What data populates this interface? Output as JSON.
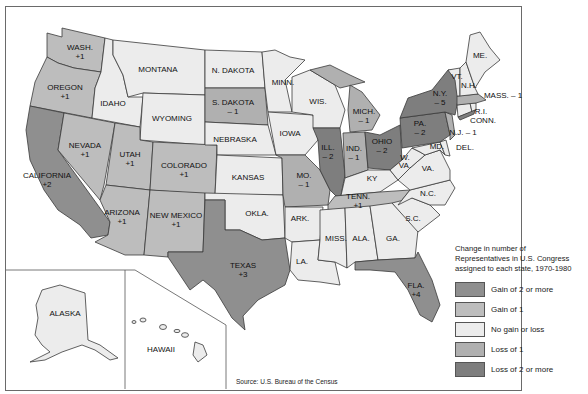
{
  "colors": {
    "gain2": "#8f8f8f",
    "gain1": "#bdbdbd",
    "none": "#ececec",
    "loss1": "#b0b0b0",
    "loss2": "#7e7e7e",
    "border": "#3a3a3a",
    "water": "#ffffff"
  },
  "legend": {
    "title_line1": "Change in number of",
    "title_line2": "Representatives in U.S. Congress",
    "title_line3": "assigned to each state, 1970-1980",
    "items": [
      {
        "key": "gain2",
        "label": "Gain of 2 or more"
      },
      {
        "key": "gain1",
        "label": "Gain of 1"
      },
      {
        "key": "none",
        "label": "No gain or loss"
      },
      {
        "key": "loss1",
        "label": "Loss of 1"
      },
      {
        "key": "loss2",
        "label": "Loss of 2 or more"
      }
    ]
  },
  "source": "Source: U.S. Bureau of the Census",
  "states": {
    "wash": {
      "name": "WASH.",
      "change": "+1"
    },
    "oregon": {
      "name": "OREGON",
      "change": "+1"
    },
    "california": {
      "name": "CALIFORNIA",
      "change": "+2"
    },
    "nevada": {
      "name": "NEVADA",
      "change": "+1"
    },
    "idaho": {
      "name": "IDAHO",
      "change": ""
    },
    "montana": {
      "name": "MONTANA",
      "change": ""
    },
    "wyoming": {
      "name": "WYOMING",
      "change": ""
    },
    "utah": {
      "name": "UTAH",
      "change": "+1"
    },
    "colorado": {
      "name": "COLORADO",
      "change": "+1"
    },
    "arizona": {
      "name": "ARIZONA",
      "change": "+1"
    },
    "newmexico": {
      "name": "NEW MEXICO",
      "change": "+1"
    },
    "ndakota": {
      "name": "N. DAKOTA",
      "change": ""
    },
    "sdakota": {
      "name": "S. DAKOTA",
      "change": "– 1"
    },
    "nebraska": {
      "name": "NEBRASKA",
      "change": ""
    },
    "kansas": {
      "name": "KANSAS",
      "change": ""
    },
    "okla": {
      "name": "OKLA.",
      "change": ""
    },
    "texas": {
      "name": "TEXAS",
      "change": "+3"
    },
    "minn": {
      "name": "MINN.",
      "change": ""
    },
    "iowa": {
      "name": "IOWA",
      "change": ""
    },
    "mo": {
      "name": "MO.",
      "change": "– 1"
    },
    "ark": {
      "name": "ARK.",
      "change": ""
    },
    "la": {
      "name": "LA.",
      "change": ""
    },
    "wis": {
      "name": "WIS.",
      "change": ""
    },
    "ill": {
      "name": "ILL.",
      "change": "– 2"
    },
    "mich": {
      "name": "MICH.",
      "change": "– 1"
    },
    "ind": {
      "name": "IND.",
      "change": "– 1"
    },
    "ohio": {
      "name": "OHIO",
      "change": "– 2"
    },
    "ky": {
      "name": "KY",
      "change": ""
    },
    "tenn": {
      "name": "TENN.",
      "change": "+1"
    },
    "miss": {
      "name": "MISS.",
      "change": ""
    },
    "ala": {
      "name": "ALA.",
      "change": ""
    },
    "ga": {
      "name": "GA.",
      "change": ""
    },
    "fla": {
      "name": "FLA.",
      "change": "+4"
    },
    "sc": {
      "name": "S.C.",
      "change": ""
    },
    "nc": {
      "name": "N.C.",
      "change": ""
    },
    "va": {
      "name": "VA.",
      "change": ""
    },
    "wva_1": "W.",
    "wva_2": "VA.",
    "md": {
      "name": "MD.",
      "change": ""
    },
    "del": {
      "name": "DEL.",
      "change": ""
    },
    "pa": {
      "name": "PA.",
      "change": "– 2"
    },
    "nj": {
      "name": "N.J. – 1",
      "change": "– 1"
    },
    "ny": {
      "name": "N.Y.",
      "change": "– 5"
    },
    "conn": {
      "name": "CONN.",
      "change": ""
    },
    "ri": {
      "name": "R.I.",
      "change": ""
    },
    "mass": {
      "name": "MASS. – 1",
      "change": "– 1"
    },
    "vt": {
      "name": "VT.",
      "change": ""
    },
    "nh": {
      "name": "N.H.",
      "change": ""
    },
    "me": {
      "name": "ME.",
      "change": ""
    },
    "alaska": {
      "name": "ALASKA",
      "change": ""
    },
    "hawaii": {
      "name": "HAWAII",
      "change": ""
    }
  }
}
